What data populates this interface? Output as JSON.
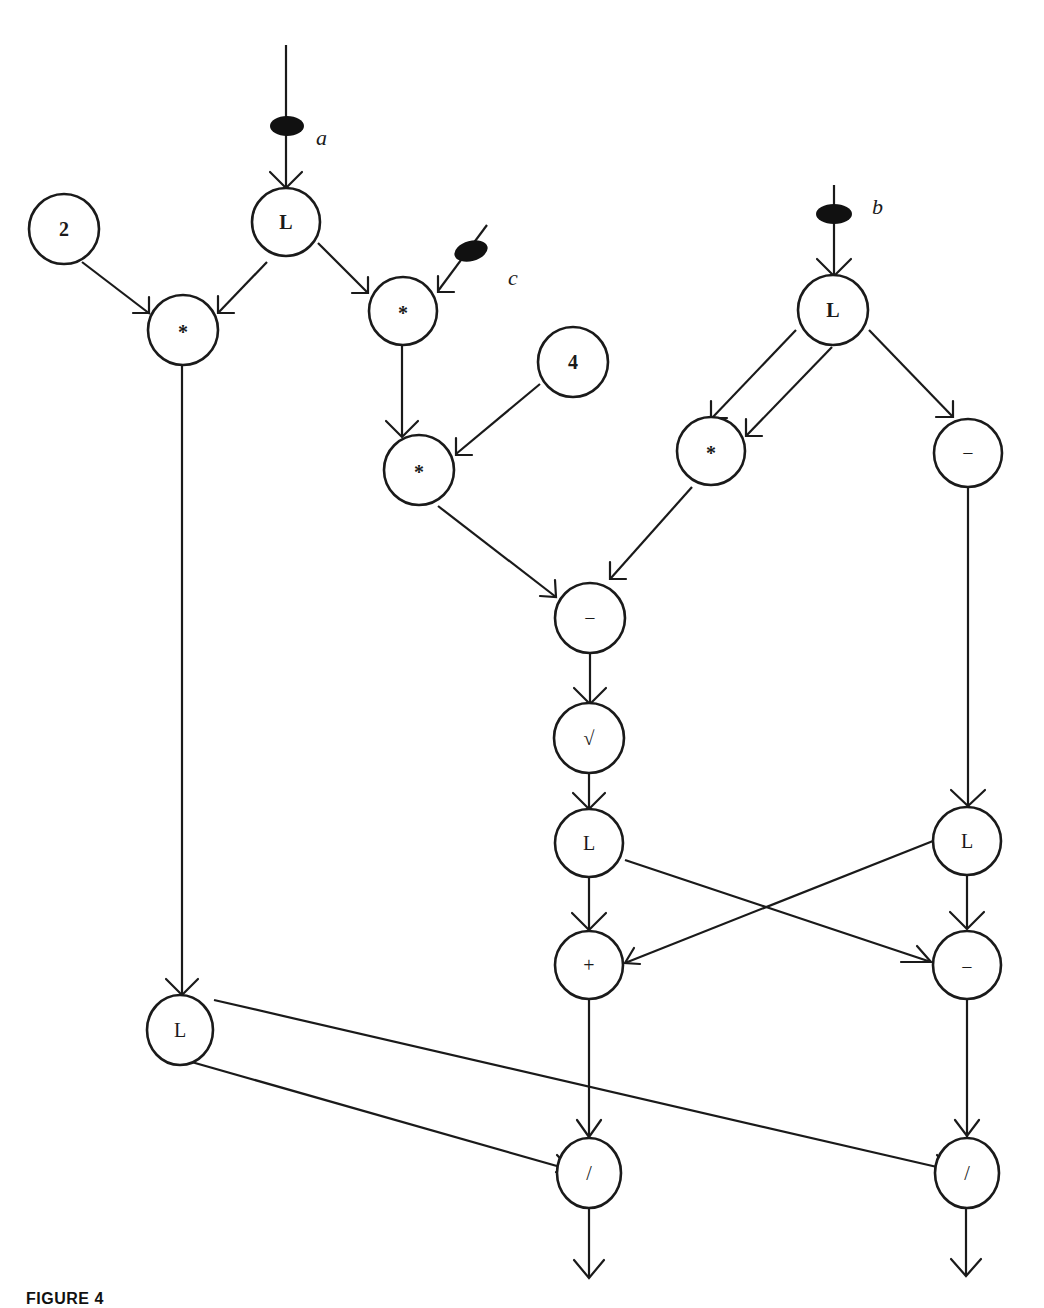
{
  "figure": {
    "caption": "FIGURE 4"
  },
  "inputs": [
    {
      "id": "a",
      "label": "a"
    },
    {
      "id": "b",
      "label": "b"
    },
    {
      "id": "c",
      "label": "c"
    }
  ],
  "nodes": [
    {
      "id": "const2",
      "label": "2",
      "kind": "constant",
      "x": 64,
      "y": 229
    },
    {
      "id": "La",
      "label": "L",
      "kind": "operator",
      "x": 286,
      "y": 222
    },
    {
      "id": "mul_2a",
      "label": "*",
      "kind": "operator",
      "x": 183,
      "y": 330
    },
    {
      "id": "mul_ac",
      "label": "*",
      "kind": "operator",
      "x": 403,
      "y": 311
    },
    {
      "id": "const4",
      "label": "4",
      "kind": "constant",
      "x": 573,
      "y": 362
    },
    {
      "id": "mul_4ac",
      "label": "*",
      "kind": "operator",
      "x": 419,
      "y": 470
    },
    {
      "id": "Lb",
      "label": "L",
      "kind": "operator",
      "x": 833,
      "y": 310
    },
    {
      "id": "mul_bb",
      "label": "*",
      "kind": "operator",
      "x": 711,
      "y": 451
    },
    {
      "id": "neg_b",
      "label": "−",
      "kind": "operator",
      "x": 968,
      "y": 453
    },
    {
      "id": "sub_disc",
      "label": "−",
      "kind": "operator",
      "x": 590,
      "y": 618
    },
    {
      "id": "sqrt",
      "label": "√",
      "kind": "operator",
      "x": 589,
      "y": 738
    },
    {
      "id": "L_sqrt",
      "label": "L",
      "kind": "operator",
      "x": 589,
      "y": 843
    },
    {
      "id": "L_negb",
      "label": "L",
      "kind": "operator",
      "x": 967,
      "y": 841
    },
    {
      "id": "add",
      "label": "+",
      "kind": "operator",
      "x": 589,
      "y": 965
    },
    {
      "id": "sub",
      "label": "−",
      "kind": "operator",
      "x": 967,
      "y": 965
    },
    {
      "id": "L_2a",
      "label": "L",
      "kind": "operator",
      "x": 180,
      "y": 1030
    },
    {
      "id": "div1",
      "label": "/",
      "kind": "operator",
      "x": 589,
      "y": 1173
    },
    {
      "id": "div2",
      "label": "/",
      "kind": "operator",
      "x": 967,
      "y": 1173
    }
  ],
  "edges": [
    [
      "input_a",
      "La"
    ],
    [
      "const2",
      "mul_2a"
    ],
    [
      "La",
      "mul_2a"
    ],
    [
      "La",
      "mul_ac"
    ],
    [
      "input_c",
      "mul_ac"
    ],
    [
      "mul_ac",
      "mul_4ac"
    ],
    [
      "const4",
      "mul_4ac"
    ],
    [
      "input_b",
      "Lb"
    ],
    [
      "Lb",
      "mul_bb"
    ],
    [
      "Lb",
      "mul_bb"
    ],
    [
      "Lb",
      "neg_b"
    ],
    [
      "mul_4ac",
      "sub_disc"
    ],
    [
      "mul_bb",
      "sub_disc"
    ],
    [
      "sub_disc",
      "sqrt"
    ],
    [
      "sqrt",
      "L_sqrt"
    ],
    [
      "neg_b",
      "L_negb"
    ],
    [
      "L_sqrt",
      "add"
    ],
    [
      "L_negb",
      "add"
    ],
    [
      "L_sqrt",
      "sub"
    ],
    [
      "L_negb",
      "sub"
    ],
    [
      "mul_2a",
      "L_2a"
    ],
    [
      "add",
      "div1"
    ],
    [
      "L_2a",
      "div1"
    ],
    [
      "sub",
      "div2"
    ],
    [
      "L_2a",
      "div2"
    ],
    [
      "div1",
      "output_1"
    ],
    [
      "div2",
      "output_2"
    ]
  ],
  "colors": {
    "ink": "#1a1a1a",
    "background": "#ffffff"
  }
}
